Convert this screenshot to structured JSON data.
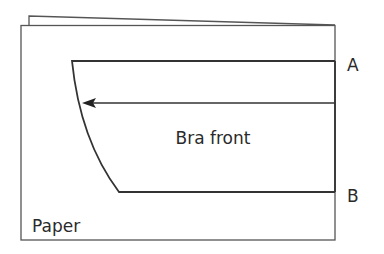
{
  "diagram": {
    "labels": {
      "pattern": "Bra front",
      "paper": "Paper",
      "point_a": "A",
      "point_b": "B"
    },
    "colors": {
      "line": "#333333",
      "paper_line": "#555555",
      "text": "#2a2a2a",
      "background": "#ffffff"
    }
  }
}
